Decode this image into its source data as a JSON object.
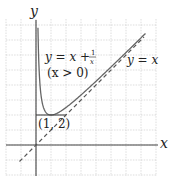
{
  "figure": {
    "type": "function-graph",
    "axes": {
      "x_label": "x",
      "y_label": "y",
      "origin_px": [
        36,
        145
      ],
      "unit_px": 15,
      "x_range": [
        -2,
        8
      ],
      "y_range": [
        -2,
        8.4
      ]
    },
    "grid": {
      "on": true,
      "spacing_units": 1,
      "color": "#c8c8c8"
    },
    "curves": [
      {
        "name": "y = x + 1/x",
        "label_line1": "y = x + ",
        "frac_num": "1",
        "frac_den": "x",
        "label_line2": "(x > 0)",
        "style": "solid",
        "color": "#555555",
        "domain": [
          0.13,
          7.3
        ]
      },
      {
        "name": "y = x",
        "label": "y = x",
        "style": "dashed",
        "color": "#555555",
        "domain": [
          -1.1,
          7.2
        ]
      }
    ],
    "point": {
      "label": "(1, 2)",
      "x": 1,
      "y": 2
    },
    "colors": {
      "axis": "#444444",
      "curve": "#666666",
      "grid": "#cccccc",
      "text": "#222222"
    }
  },
  "chart_data": {
    "type": "line",
    "title": "",
    "xlabel": "x",
    "ylabel": "y",
    "xlim": [
      -2,
      8
    ],
    "ylim": [
      -2,
      8.4
    ],
    "grid": true,
    "series": [
      {
        "name": "y = x + 1/x (x > 0)",
        "style": "solid",
        "x": [
          0.13,
          0.2,
          0.3,
          0.5,
          0.75,
          1,
          1.5,
          2,
          3,
          4,
          5,
          6,
          7.3
        ],
        "y": [
          7.82,
          5.2,
          3.63,
          2.5,
          2.08,
          2,
          2.17,
          2.5,
          3.33,
          4.25,
          5.2,
          6.17,
          7.44
        ]
      },
      {
        "name": "y = x",
        "style": "dashed",
        "x": [
          -1.1,
          7.2
        ],
        "y": [
          -1.1,
          7.2
        ]
      }
    ],
    "annotations": [
      {
        "text": "y = x + 1/x",
        "x": 2.4,
        "y": 6.4
      },
      {
        "text": "(x > 0)",
        "x": 2.6,
        "y": 5.3
      },
      {
        "text": "y = x",
        "x": 5.6,
        "y": 5.9
      },
      {
        "text": "(1, 2)",
        "x": 1,
        "y": 1.3,
        "marks_point": [
          1,
          2
        ]
      }
    ]
  }
}
